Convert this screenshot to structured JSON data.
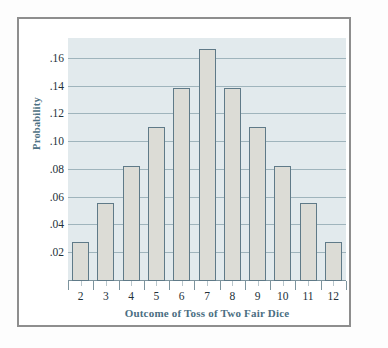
{
  "chart_data": {
    "type": "bar",
    "title": "",
    "xlabel": "Outcome of Toss of Two Fair Dice",
    "ylabel": "Probability",
    "categories": [
      "2",
      "3",
      "4",
      "5",
      "6",
      "7",
      "8",
      "9",
      "10",
      "11",
      "12"
    ],
    "values": [
      0.028,
      0.056,
      0.083,
      0.111,
      0.139,
      0.167,
      0.139,
      0.111,
      0.083,
      0.056,
      0.028
    ],
    "ylim": [
      0,
      0.175
    ],
    "yticks": [
      0.02,
      0.04,
      0.06,
      0.08,
      0.1,
      0.12,
      0.14,
      0.16
    ],
    "ytick_labels": [
      ".02",
      ".04",
      ".06",
      ".08",
      ".10",
      ".12",
      ".14",
      ".16"
    ],
    "grid": true,
    "legend": "none",
    "colors": {
      "bar_fill": "#dcdcd6",
      "bar_edge": "#5f7a88",
      "plot_background": "#e2eaed",
      "gridline": "#9fb4bc",
      "axis_title": "#4a6e82",
      "tick_label": "#23313a",
      "frame": "#8e8e8e"
    }
  }
}
